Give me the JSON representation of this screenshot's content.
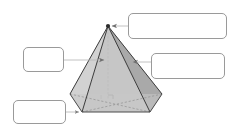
{
  "diagram": {
    "shape_name": "hexagonal pyramid",
    "background_color": "#ffffff",
    "solid": {
      "face_light_color": "#d8d8d8",
      "face_mid_color": "#c9c9c9",
      "face_dark_color": "#a9a9a9",
      "base_color": "#c4c4c4",
      "edge_color": "#3c3c3c",
      "hidden_edge_color": "#8d8d8d",
      "apex_vertex_color": "#2b2b2b",
      "axis_color": "#b4b4b4",
      "right_angle_color": "#b0b0b0"
    },
    "callouts": [
      {
        "id": "apex",
        "name": "apex-callout",
        "text": "",
        "points_to": "apex vertex",
        "arrow_direction": "left",
        "border_color": "#9a9a9a"
      },
      {
        "id": "slant-height",
        "name": "slant-height-callout",
        "text": "",
        "points_to": "slant face / lateral edge",
        "arrow_direction": "left",
        "border_color": "#9a9a9a"
      },
      {
        "id": "height",
        "name": "height-callout",
        "text": "",
        "points_to": "vertical height axis",
        "arrow_direction": "right",
        "border_color": "#9a9a9a"
      },
      {
        "id": "base-edge",
        "name": "base-edge-callout",
        "text": "",
        "points_to": "base edge vertex",
        "arrow_direction": "right",
        "border_color": "#9a9a9a"
      }
    ]
  }
}
